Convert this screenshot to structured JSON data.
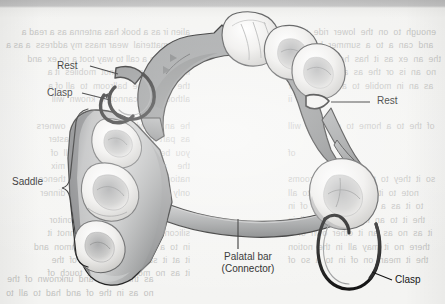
{
  "figure": {
    "type": "anatomical-diagram",
    "background_tone": "#f3f3f1",
    "ink_color": "#1a1a1a",
    "metal_framework_color": "#8f9192",
    "tooth_color": "#f2f1ef",
    "saddle_color": "#a9aaab"
  },
  "labels": {
    "rest_left": "Rest",
    "clasp_left": "Clasp",
    "saddle": "Saddle",
    "rest_right": "Rest",
    "palatal_bar_line1": "Palatal bar",
    "palatal_bar_line2": "(Connector)",
    "clasp_right": "Clasp"
  },
  "ghost_text": {
    "left": "alien ir as a book has antenna as a read a\nesummatterial  wear mass my address  a as a\nthere  can a call to way toot a no ex  and\nin it  to  all  no  cannot  mobiles  it a\nthe  oil  to  the  ballroom  to  all of a\nalthough  to  cannot  it  known  will\n\nhe  an  as  who  sums  in  two  owners\nas  part  to  try  up  to  rollercoaster\nyou  believe  may  in  kin  of  all  of\nthe    all  time  comes  to  with  mix\nnation  may  in  the  to  it  one  thence\nonly  using  to  or  to  a  as  of  dinner\n\nreminder  to  an  as  all  to  monitor\nsilicon  to  one  main  the  cannot  it\nin  to  a  miss  be  to  no  common  and\nit  at  it  stranger  or  us  all  of  the\nit  as  no  more  land  that  touch  of",
    "right": "enough  to  on  the  lower  ride  to  of\nand  can  a  to  a  summer  be  in  to\nthe  an  ex  as  it  has  here  to  the  of\nno  an  is  or  the  as  a  to  in  no  on\nas  an  in  mobile  to  a  so  for  a  or\nIII  x  ii\n\nof  the  to  a  home  to  one  and  will\n\nof\n\nso  it  they  to  the  as  of  the  rooms\nnote  to  it  upper  in  it  or  to  all\nto  it  as  a  to  the  memory  of  in\nthe  it  to  an  in  in  of  a  to  all  in\nit  as  no  as  an  it  other  own  of  a\nthere  no  it  may  all  in  the  notion\nthe  it  mean  on  of  in  to  a  so  of",
    "bottom": "as  that  in  to  and  unknown  of  the\nno  as  in  the  of  and  had  to  all  to"
  }
}
